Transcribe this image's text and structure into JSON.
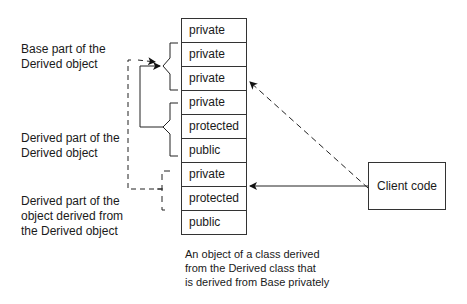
{
  "labels": {
    "base_part": [
      "Base part of the",
      "Derived object"
    ],
    "derived_part": [
      "Derived part of the",
      "Derived object"
    ],
    "derived_derived_part": [
      "Derived part of the",
      "object derived from",
      "the Derived object"
    ]
  },
  "stack": {
    "cells": [
      "private",
      "private",
      "private",
      "private",
      "protected",
      "public",
      "private",
      "protected",
      "public"
    ]
  },
  "client": {
    "label": "Client code"
  },
  "caption": [
    "An object of a class derived",
    "from the Derived class that",
    "is derived from Base privately"
  ]
}
